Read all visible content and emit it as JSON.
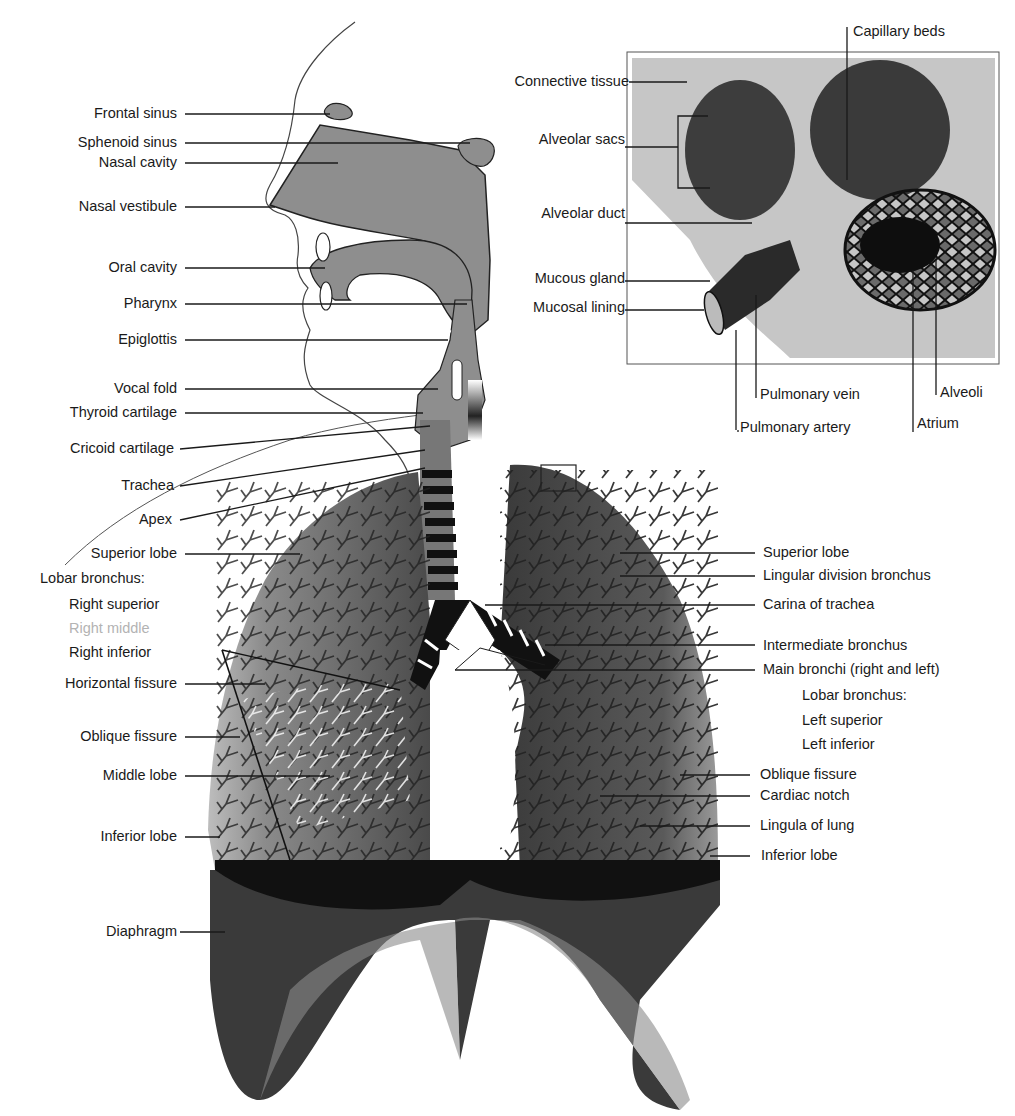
{
  "diagram": {
    "colors": {
      "line": "#1a1a1a",
      "tissue_gray": "#8a8a8a",
      "lung_dark": "#3c3c3c",
      "lung_mid": "#6e6e6e",
      "diaphragm": "#2e2e2e",
      "inset_bg": "#c9c9c9",
      "faded_label": "#b3b3b3"
    },
    "head_labels": [
      "Frontal sinus",
      "Sphenoid sinus",
      "Nasal cavity",
      "Nasal vestibule",
      "Oral cavity",
      "Pharynx",
      "Epiglottis",
      "Vocal fold",
      "Thyroid cartilage",
      "Cricoid cartilage",
      "Trachea",
      "Apex"
    ],
    "right_lung_labels": {
      "superior_lobe": "Superior lobe",
      "lobar_bronchus_heading": "Lobar bronchus:",
      "lobar_bronchus_items": [
        "Right superior",
        "Right middle",
        "Right inferior"
      ],
      "horizontal_fissure": "Horizontal fissure",
      "oblique_fissure": "Oblique fissure",
      "middle_lobe": "Middle lobe",
      "inferior_lobe": "Inferior lobe",
      "diaphragm": "Diaphragm"
    },
    "left_lung_labels": {
      "superior_lobe": "Superior lobe",
      "lingular_division_bronchus": "Lingular division bronchus",
      "carina": "Carina of trachea",
      "intermediate_bronchus": "Intermediate bronchus",
      "main_bronchi": "Main bronchi (right and left)",
      "lobar_bronchus_heading": "Lobar bronchus:",
      "lobar_bronchus_items": [
        "Left superior",
        "Left inferior"
      ],
      "oblique_fissure": "Oblique fissure",
      "cardiac_notch": "Cardiac notch",
      "lingula": "Lingula of lung",
      "inferior_lobe": "Inferior lobe"
    },
    "inset_labels": {
      "capillary_beds": "Capillary beds",
      "connective_tissue": "Connective tissue",
      "alveolar_sacs": "Alveolar sacs",
      "alveolar_duct": "Alveolar duct",
      "mucous_gland": "Mucous gland",
      "mucosal_lining": "Mucosal lining",
      "pulmonary_vein": "Pulmonary vein",
      "pulmonary_artery": "Pulmonary artery",
      "atrium": "Atrium",
      "alveoli": "Alveoli"
    }
  }
}
